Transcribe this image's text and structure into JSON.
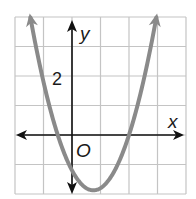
{
  "chart_data": {
    "type": "line",
    "title": "",
    "xlabel": "x",
    "ylabel": "y",
    "origin_label": "O",
    "tick_labels": [
      {
        "axis": "y",
        "value": 2,
        "text": "2"
      }
    ],
    "xlim": [
      -2.5,
      3.5
    ],
    "ylim": [
      -2,
      4
    ],
    "grid": true,
    "grid_step": 1,
    "series": [
      {
        "name": "parabola",
        "kind": "quadratic",
        "roots": [
          -0.5,
          2
        ],
        "y_intercept": -1.2,
        "vertex": [
          0.75,
          -1.875
        ],
        "x": [
          -1.5,
          -1.0,
          -0.5,
          0.0,
          0.5,
          0.75,
          1.0,
          1.5,
          2.0,
          2.5,
          3.0
        ],
        "y": [
          4.2,
          1.8,
          0.0,
          -1.2,
          -1.8,
          -1.875,
          -1.8,
          -1.2,
          0.0,
          1.8,
          4.2
        ],
        "color": "#8a8a8a"
      }
    ],
    "colors": {
      "grid": "#c4c4c4",
      "axes": "#111111",
      "curve": "#8a8a8a"
    }
  },
  "labels": {
    "x_axis": "x",
    "y_axis": "y",
    "origin": "O",
    "y_tick_2": "2"
  }
}
